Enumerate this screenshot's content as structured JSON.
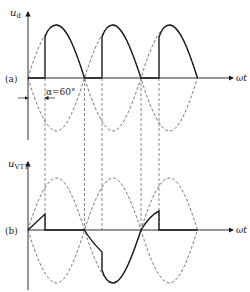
{
  "panels": [
    {
      "id": "a",
      "tag": "(a)",
      "y_label": "u",
      "y_label_sub": "d",
      "x_label": "ωt",
      "annotation": "α=60°"
    },
    {
      "id": "b",
      "tag": "(b)",
      "y_label": "u",
      "y_label_sub": "VT1",
      "x_label": "ωt"
    }
  ],
  "parameters": {
    "firing_angle_deg": 60
  },
  "colors": {
    "stroke": "#1a1a1a",
    "dashed": "#555555",
    "background": "#ffffff"
  }
}
